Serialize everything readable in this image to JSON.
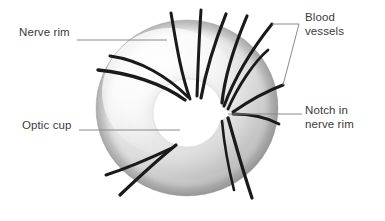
{
  "figure": {
    "type": "anatomical-diagram",
    "background_color": "#ffffff",
    "text_color": "#3b3b3b",
    "vessel_color": "#1a1a1a",
    "leader_color": "#8a8a8a",
    "rim_light": "#fcfcfc",
    "rim_mid": "#dedede",
    "rim_dark": "#9b9b9b",
    "cup_color": "#ffffff"
  },
  "labels": {
    "nerve_rim": "Nerve rim",
    "optic_cup": "Optic cup",
    "blood_vessels_line1": "Blood",
    "blood_vessels_line2": "vessels",
    "notch_line1": "Notch in",
    "notch_line2": "nerve rim"
  }
}
